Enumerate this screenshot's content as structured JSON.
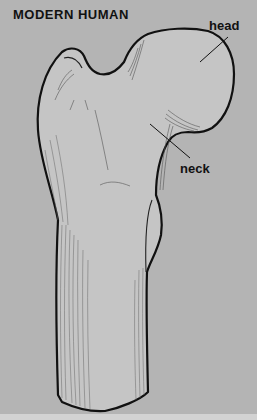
{
  "figure": {
    "title": "MODERN HUMAN",
    "labels": [
      {
        "id": "head",
        "text": "head"
      },
      {
        "id": "neck",
        "text": "neck"
      }
    ]
  },
  "colors": {
    "background": "#b4b4b4",
    "bone_fill": "#c4c4c4",
    "outline": "#111111",
    "hatching": "#555555"
  }
}
